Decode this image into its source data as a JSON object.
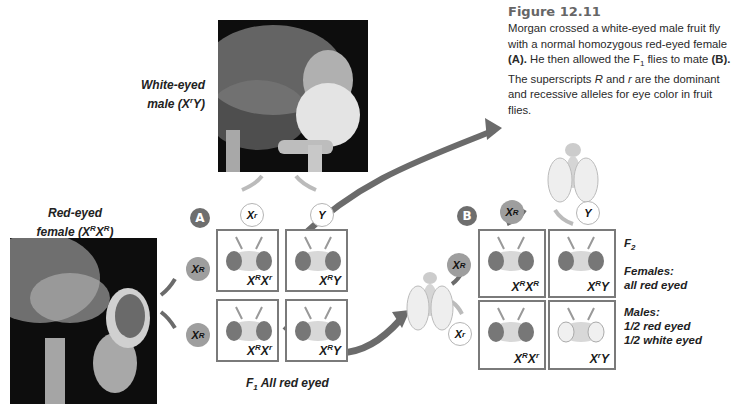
{
  "caption": {
    "title": "Figure 12.11",
    "text_parts": {
      "p1": "Morgan crossed a white-eyed male fruit fly with a normal homozygous red-eyed female ",
      "p1b": "(A).",
      "p2": " He then allowed the F",
      "p2sub": "1",
      "p3": " flies to mate ",
      "p3b": "(B).",
      "p4": " The superscripts ",
      "p4i": "R",
      "p5": " and ",
      "p5i": "r",
      "p6": " are the dominant and recessive alleles for eye color in fruit flies."
    }
  },
  "parents": {
    "male": {
      "line1": "White-eyed",
      "line2": "male (X",
      "sup": "r",
      "line2_end": "Y)"
    },
    "female": {
      "line1": "Red-eyed",
      "line2": "female (X",
      "sup1": "R",
      "mid": "X",
      "sup2": "R",
      "end": ")"
    }
  },
  "cross_a": {
    "badge": "A",
    "top_alleles": [
      {
        "base": "X",
        "sup": "r",
        "type": "white"
      },
      {
        "base": "Y",
        "sup": "",
        "type": "white"
      }
    ],
    "side_alleles": [
      {
        "base": "X",
        "sup": "R",
        "type": "red"
      },
      {
        "base": "X",
        "sup": "R",
        "type": "red"
      }
    ],
    "cells": [
      {
        "g1": "X",
        "s1": "R",
        "g2": "X",
        "s2": "r",
        "eye": "red"
      },
      {
        "g1": "X",
        "s1": "R",
        "g2": "Y",
        "s2": "",
        "eye": "red"
      },
      {
        "g1": "X",
        "s1": "R",
        "g2": "X",
        "s2": "r",
        "eye": "red"
      },
      {
        "g1": "X",
        "s1": "R",
        "g2": "Y",
        "s2": "",
        "eye": "red"
      }
    ],
    "result": {
      "pre": "F",
      "sub": "1",
      "text": " All red eyed"
    }
  },
  "cross_b": {
    "badge": "B",
    "top_alleles": [
      {
        "base": "X",
        "sup": "R",
        "type": "red"
      },
      {
        "base": "Y",
        "sup": "",
        "type": "white"
      }
    ],
    "side_alleles": [
      {
        "base": "X",
        "sup": "R",
        "type": "red"
      },
      {
        "base": "X",
        "sup": "r",
        "type": "white"
      }
    ],
    "cells": [
      {
        "g1": "X",
        "s1": "R",
        "g2": "X",
        "s2": "R",
        "eye": "red"
      },
      {
        "g1": "X",
        "s1": "R",
        "g2": "Y",
        "s2": "",
        "eye": "red"
      },
      {
        "g1": "X",
        "s1": "R",
        "g2": "X",
        "s2": "r",
        "eye": "red"
      },
      {
        "g1": "X",
        "s1": "r",
        "g2": "Y",
        "s2": "",
        "eye": "white"
      }
    ],
    "f2_label": {
      "pre": "F",
      "sub": "2"
    },
    "females": {
      "l1": "Females:",
      "l2": "all red eyed"
    },
    "males": {
      "l1": "Males:",
      "l2": "1/2 red eyed",
      "l3": "1/2 white eyed"
    }
  },
  "colors": {
    "arrow": "#6b6b6b",
    "cell_border": "#7a7a7a",
    "red_allele": "#9e9e9e",
    "badge": "#6e6e6e"
  }
}
